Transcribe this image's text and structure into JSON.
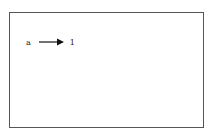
{
  "diagram": {
    "mapping": {
      "from": "a",
      "to": "1",
      "arrow": "right-arrow"
    },
    "colors": {
      "border": "#555555",
      "text": "#222222",
      "arrow": "#111111"
    }
  }
}
